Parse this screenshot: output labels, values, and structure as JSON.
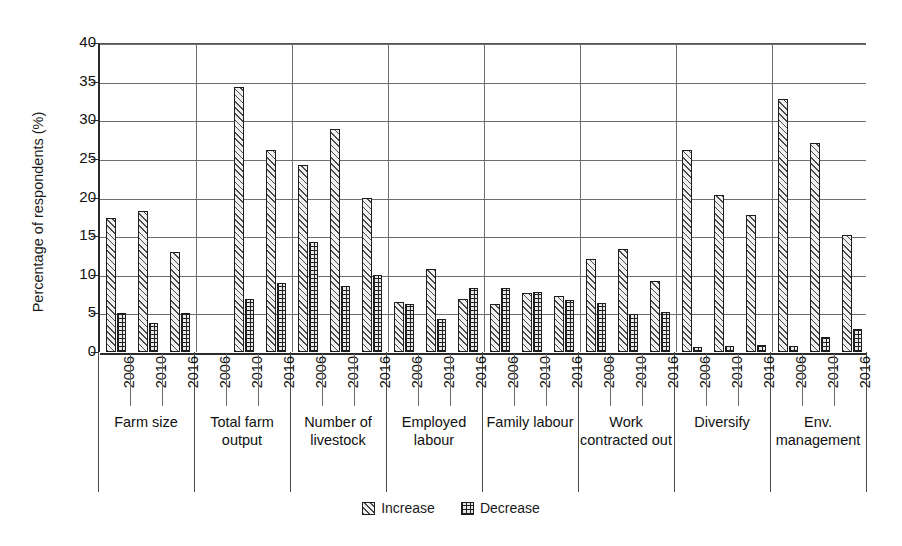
{
  "chart_data": {
    "type": "bar",
    "title": "",
    "xlabel": "",
    "ylabel": "Percentage of respondents (%)",
    "ylim": [
      0,
      40
    ],
    "yticks": [
      0,
      5,
      10,
      15,
      20,
      25,
      30,
      35,
      40
    ],
    "grid": true,
    "legend_position": "bottom",
    "legend": [
      "Increase",
      "Decrease"
    ],
    "x": [
      "2006",
      "2010",
      "2016"
    ],
    "categories": [
      "Farm size",
      "Total farm output",
      "Number of livestock",
      "Employed labour",
      "Family labour",
      "Work contracted out",
      "Diversify",
      "Env. management"
    ],
    "series": [
      {
        "name": "Increase",
        "values": [
          [
            17.4,
            18.3,
            13.0
          ],
          [
            0.0,
            34.3,
            26.2
          ],
          [
            24.2,
            28.9,
            19.9
          ],
          [
            6.5,
            10.8,
            6.8
          ],
          [
            6.2,
            7.7,
            7.2
          ],
          [
            12.1,
            13.3,
            9.2
          ],
          [
            26.2,
            20.3,
            17.7
          ],
          [
            32.7,
            27.0,
            15.2
          ]
        ]
      },
      {
        "name": "Decrease",
        "values": [
          [
            5.0,
            3.8,
            5.0
          ],
          [
            0.0,
            6.8,
            8.9
          ],
          [
            14.3,
            8.5,
            10.0
          ],
          [
            6.2,
            4.3,
            8.3
          ],
          [
            8.3,
            7.8,
            6.7
          ],
          [
            6.3,
            4.9,
            5.2
          ],
          [
            0.6,
            0.8,
            0.9
          ],
          [
            0.8,
            2.0,
            3.0
          ]
        ]
      }
    ]
  },
  "axis": {
    "y_title": "Percentage of respondents (%)",
    "y_tick_labels": [
      "40",
      "35",
      "30",
      "25",
      "20",
      "15",
      "10",
      "5",
      "0"
    ]
  },
  "legend": {
    "increase_label": "Increase",
    "decrease_label": "Decrease"
  },
  "category_labels": [
    "Farm size",
    "Total farm output",
    "Number of livestock",
    "Employed labour",
    "Family labour",
    "Work contracted out",
    "Diversify",
    "Env. management"
  ],
  "year_labels": [
    "2006",
    "2010",
    "2016"
  ],
  "colors": {
    "axis": "#2b2b2b",
    "grid": "#6d6d6d",
    "bar_outline": "#1d1d1d",
    "increase_fill": "#f0f0f0",
    "decrease_fill": "#e8e8e8",
    "text": "#111111"
  }
}
